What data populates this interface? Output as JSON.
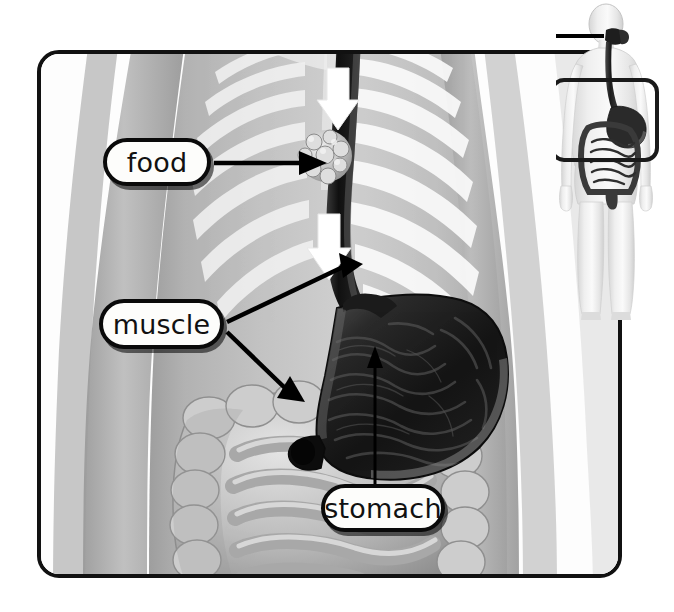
{
  "figure": {
    "type": "anatomical-diagram",
    "background_color": "#ffffff",
    "frame_color": "#111111"
  },
  "labels": [
    {
      "id": "food",
      "text": "food",
      "points_to": "food-bolus-in-esophagus"
    },
    {
      "id": "muscle",
      "text": "muscle",
      "points_to": "cardiac-sphincter, pyloric-sphincter"
    },
    {
      "id": "stomach",
      "text": "stomach",
      "points_to": "stomach-body"
    }
  ],
  "structures": {
    "esophagus": "esophagus",
    "stomach": "stomach",
    "small_intestine": "small intestine",
    "large_intestine": "large intestine",
    "food_bolus": "food bolus",
    "cardiac_sphincter": "upper stomach muscle",
    "pyloric_sphincter": "lower stomach muscle",
    "ribcage": "rib cage",
    "torso": "torso silhouette"
  },
  "inset": {
    "description": "whole body figure with digestive tract highlighted",
    "zoom_frame": "abdomen region magnified in main view"
  },
  "colors": {
    "organ_dark": "#1a1a1a",
    "organ_mid": "#555555",
    "intestine": "#b8b8b8",
    "torso": "#b4b4b4",
    "bone": "#efefef",
    "label_fill": "#fdfdfb",
    "outline": "#0a0a0a"
  },
  "arrows": {
    "swallow_upper": "downward arrow (food moving down)",
    "swallow_lower": "downward arrow (food moving down)"
  }
}
